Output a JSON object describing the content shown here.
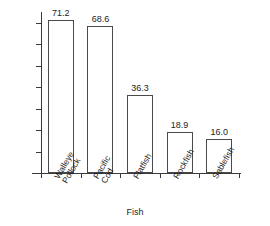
{
  "chart_data": {
    "type": "bar",
    "title": "",
    "xlabel": "Fish",
    "ylabel": "",
    "categories": [
      "Walleye\nPollock",
      "Pacific\nCod",
      "Flatfish",
      "Rockfish",
      "Sablefish"
    ],
    "categories_flat": [
      "Walleye Pollock",
      "Pacific Cod",
      "Flatfish",
      "Rockfish",
      "Sablefish"
    ],
    "values": [
      71.2,
      68.6,
      36.3,
      18.9,
      16.0
    ],
    "value_labels": [
      "71.2",
      "68.6",
      "36.3",
      "18.9",
      "16.0"
    ],
    "ylim": [
      0,
      75
    ],
    "yticks": [
      10,
      20,
      30,
      40,
      50,
      60,
      70
    ],
    "ytick_labels": [
      "10",
      "20",
      "30",
      "40",
      "50",
      "60",
      "70"
    ],
    "grid": false,
    "legend": false,
    "bar_fill_color": "#ffffff",
    "bar_edge_color": "#4a4a4a",
    "axis_color": "#3a3a3a",
    "text_color": "#1d1d1d"
  }
}
